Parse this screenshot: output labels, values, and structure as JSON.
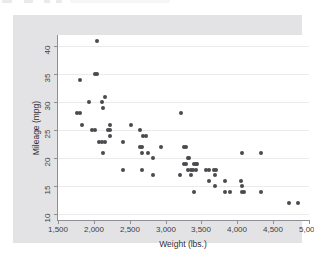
{
  "chart_data": {
    "type": "scatter",
    "title": "",
    "xlabel": "Weight (lbs.)",
    "ylabel": "Mileage (mpg)",
    "xlim": [
      1500,
      5000
    ],
    "ylim": [
      9,
      42
    ],
    "xticks": [
      1500,
      2000,
      2500,
      3000,
      3500,
      4000,
      4500,
      5000
    ],
    "xtick_labels": [
      "1,500",
      "2,000",
      "2,500",
      "3,000",
      "3,500",
      "4,000",
      "4,500",
      "5,000"
    ],
    "yticks": [
      10,
      15,
      20,
      25,
      30,
      35,
      40
    ],
    "ytick_labels": [
      "10",
      "15",
      "20",
      "25",
      "30",
      "35",
      "40"
    ],
    "grid": "horizontal",
    "legend": "none",
    "marker": {
      "shape": "circle",
      "color": "#4a4a4f",
      "size_px": 4
    },
    "plot_background": "#ffffff",
    "graph_background": "#e3e3e5",
    "gridline_color": "#eceaea",
    "axis_color": "#8e8e93",
    "n_points": 74,
    "points": [
      [
        2040,
        41
      ],
      [
        1800,
        34
      ],
      [
        2020,
        35
      ],
      [
        2050,
        35
      ],
      [
        1930,
        30
      ],
      [
        2160,
        31
      ],
      [
        2110,
        30
      ],
      [
        2130,
        29
      ],
      [
        1760,
        28
      ],
      [
        1800,
        28
      ],
      [
        3210,
        28
      ],
      [
        1830,
        26
      ],
      [
        1980,
        25
      ],
      [
        2020,
        25
      ],
      [
        2200,
        25
      ],
      [
        2230,
        25
      ],
      [
        2230,
        24
      ],
      [
        2520,
        26
      ],
      [
        2230,
        26
      ],
      [
        2650,
        25
      ],
      [
        2690,
        24
      ],
      [
        2730,
        24
      ],
      [
        2070,
        23
      ],
      [
        2120,
        23
      ],
      [
        2160,
        23
      ],
      [
        2410,
        23
      ],
      [
        2640,
        22
      ],
      [
        2670,
        22
      ],
      [
        2930,
        22
      ],
      [
        3250,
        22
      ],
      [
        3280,
        22
      ],
      [
        2130,
        21
      ],
      [
        2670,
        21
      ],
      [
        2750,
        21
      ],
      [
        4060,
        21
      ],
      [
        4330,
        21
      ],
      [
        2830,
        20
      ],
      [
        3310,
        20
      ],
      [
        3330,
        20
      ],
      [
        3250,
        19
      ],
      [
        3280,
        19
      ],
      [
        3400,
        19
      ],
      [
        3420,
        19
      ],
      [
        3440,
        19
      ],
      [
        2400,
        18
      ],
      [
        2670,
        18
      ],
      [
        3310,
        18
      ],
      [
        3360,
        18
      ],
      [
        3380,
        18
      ],
      [
        3420,
        18
      ],
      [
        3570,
        18
      ],
      [
        3600,
        18
      ],
      [
        3670,
        18
      ],
      [
        3700,
        18
      ],
      [
        2830,
        17
      ],
      [
        3200,
        17
      ],
      [
        3350,
        17
      ],
      [
        3690,
        17
      ],
      [
        3600,
        16
      ],
      [
        3830,
        16
      ],
      [
        4050,
        16
      ],
      [
        3690,
        15
      ],
      [
        4060,
        15
      ],
      [
        3400,
        14
      ],
      [
        3830,
        14
      ],
      [
        3900,
        14
      ],
      [
        4060,
        14
      ],
      [
        4100,
        14
      ],
      [
        4330,
        14
      ],
      [
        4720,
        12
      ],
      [
        4840,
        12
      ]
    ]
  }
}
